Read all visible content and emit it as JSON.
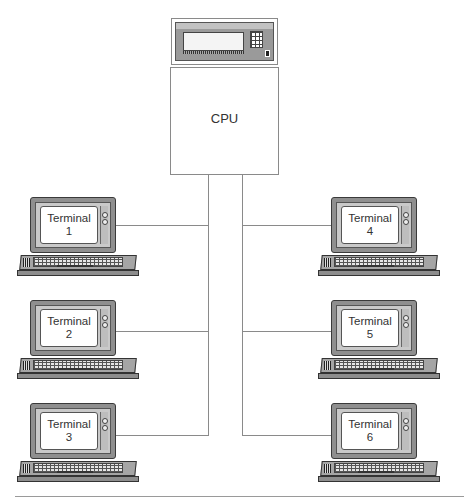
{
  "diagram": {
    "type": "time-sharing / terminal network",
    "cpu": {
      "label": "CPU",
      "console": {
        "has_display": true,
        "has_keypad": true,
        "has_switch": true
      }
    },
    "terminals": [
      {
        "label": "Terminal",
        "number": "1",
        "side": "left",
        "row": 1
      },
      {
        "label": "Terminal",
        "number": "2",
        "side": "left",
        "row": 2
      },
      {
        "label": "Terminal",
        "number": "3",
        "side": "left",
        "row": 3
      },
      {
        "label": "Terminal",
        "number": "4",
        "side": "right",
        "row": 1
      },
      {
        "label": "Terminal",
        "number": "5",
        "side": "right",
        "row": 2
      },
      {
        "label": "Terminal",
        "number": "6",
        "side": "right",
        "row": 3
      }
    ],
    "connections": [
      {
        "from": "CPU",
        "to": "Terminal 1"
      },
      {
        "from": "CPU",
        "to": "Terminal 2"
      },
      {
        "from": "CPU",
        "to": "Terminal 3"
      },
      {
        "from": "CPU",
        "to": "Terminal 4"
      },
      {
        "from": "CPU",
        "to": "Terminal 5"
      },
      {
        "from": "CPU",
        "to": "Terminal 6"
      }
    ],
    "colors": {
      "line": "#8a8a8a",
      "device_body": "#8f8f8f",
      "screen": "#ffffff",
      "text": "#333333"
    }
  }
}
